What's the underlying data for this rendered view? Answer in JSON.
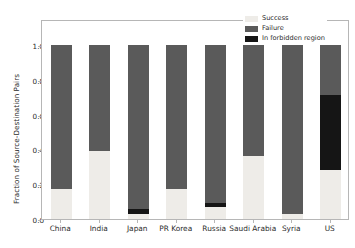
{
  "chart_data": {
    "type": "bar",
    "stacked": true,
    "title": "",
    "xlabel": "",
    "ylabel": "Fraction of Source-Destination Pairs",
    "ylim": [
      0.0,
      1.0
    ],
    "yticks": [
      "0.0",
      "0.2",
      "0.4",
      "0.6",
      "0.8",
      "1.0"
    ],
    "ytick_values": [
      0.0,
      0.2,
      0.4,
      0.6,
      0.8,
      1.0
    ],
    "grid": false,
    "legend_position": "upper right",
    "categories": [
      "China",
      "India",
      "Japan",
      "PR Korea",
      "Russia",
      "Saudi Arabia",
      "Syria",
      "US"
    ],
    "series": [
      {
        "name": "Success",
        "color": "#eeece8",
        "values": [
          0.17,
          0.39,
          0.03,
          0.175,
          0.07,
          0.36,
          0.03,
          0.28
        ]
      },
      {
        "name": "In forbidden region",
        "color": "#151515",
        "values": [
          0.0,
          0.0,
          0.03,
          0.0,
          0.02,
          0.0,
          0.0,
          0.43
        ]
      },
      {
        "name": "Failure",
        "color": "#5a5a5a",
        "values": [
          0.83,
          0.61,
          0.94,
          0.825,
          0.91,
          0.64,
          0.97,
          0.29
        ]
      }
    ],
    "stack_order": [
      "Success",
      "In forbidden region",
      "Failure"
    ],
    "legend": [
      {
        "label": "Success",
        "color": "#eeece8"
      },
      {
        "label": "Failure",
        "color": "#5a5a5a"
      },
      {
        "label": "In forbidden region",
        "color": "#151515"
      }
    ]
  },
  "axes": {
    "frame_color": "#b6b6b6",
    "tick_color": "#2b2b2b"
  }
}
